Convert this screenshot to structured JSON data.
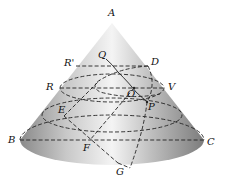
{
  "diagram": {
    "type": "cone-geometry",
    "labels": {
      "A": "A",
      "B": "B",
      "C": "C",
      "D": "D",
      "E": "E",
      "F": "F",
      "G": "G",
      "O": "O",
      "P": "P",
      "Q": "Q",
      "R": "R",
      "R_prime": "R'",
      "V": "V"
    },
    "colors": {
      "cone_light": "#f2f2f2",
      "cone_dark": "#7a7a7a",
      "line": "#222222"
    }
  }
}
